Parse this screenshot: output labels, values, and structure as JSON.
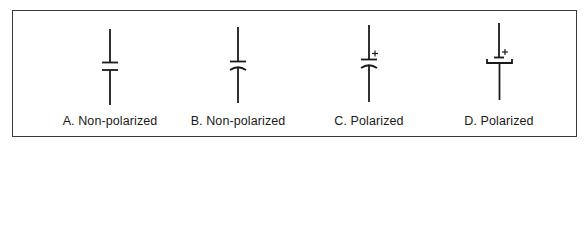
{
  "figure": {
    "border_color": "#3a3a3a",
    "stroke_color": "#1a1a1a",
    "symbols": [
      {
        "id": "A",
        "label": "A. Non-polarized",
        "type": "non-polarized",
        "plates": "two-straight",
        "polarity_mark": ""
      },
      {
        "id": "B",
        "label": "B.  Non-polarized",
        "type": "non-polarized",
        "plates": "straight-and-curved",
        "polarity_mark": ""
      },
      {
        "id": "C",
        "label": "C. Polarized",
        "type": "polarized",
        "plates": "straight-and-curved",
        "polarity_mark": "+"
      },
      {
        "id": "D",
        "label": "D.  Polarized",
        "type": "polarized",
        "plates": "straight-and-bracket",
        "polarity_mark": "+"
      }
    ]
  }
}
